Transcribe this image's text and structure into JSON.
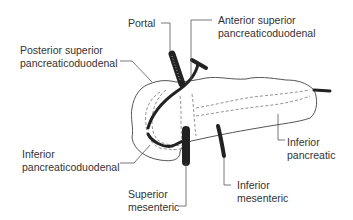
{
  "diagram": {
    "labels": {
      "portal": [
        "Portal"
      ],
      "anterior_superior_pd": [
        "Anterior superior",
        "pancreaticoduodenal"
      ],
      "posterior_superior_pd": [
        "Posterior superior",
        "pancreaticoduodenal"
      ],
      "inferior_pd": [
        "Inferior",
        "pancreaticoduodenal"
      ],
      "inferior_pancreatic": [
        "Inferior",
        "pancreatic"
      ],
      "superior_mesenteric": [
        "Superior",
        "mesenteric"
      ],
      "inferior_mesenteric": [
        "Inferior",
        "mesenteric"
      ]
    },
    "colors": {
      "text": "#333333",
      "outline": "#555555",
      "vessel": "#222222",
      "leader": "#555555"
    }
  }
}
